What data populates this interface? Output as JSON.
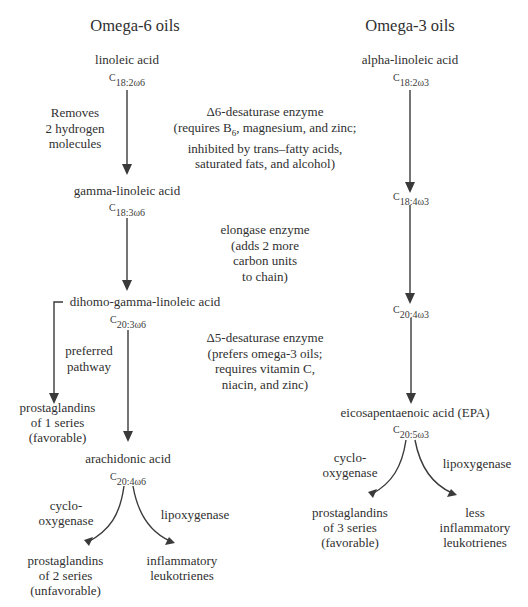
{
  "omega6": {
    "heading": "Omega-6 oils",
    "linoleic": {
      "name": "linoleic acid",
      "formula_c": "C",
      "formula_sub": "18:2ω6"
    },
    "step1_note": "Removes\n2 hydrogen\nmolecules",
    "gamma": {
      "name": "gamma-linoleic acid",
      "formula_c": "C",
      "formula_sub": "18:3ω6"
    },
    "dihomo": {
      "name": "dihomo-gamma-linoleic acid",
      "formula_c": "C",
      "formula_sub": "20:3ω6"
    },
    "preferred_note": "preferred\npathway",
    "pg1": "prostaglandins\nof 1 series\n(favorable)",
    "arachidonic": {
      "name": "arachidonic acid",
      "formula_c": "C",
      "formula_sub": "20:4ω6"
    },
    "cyclo_label": "cyclo-\noxygenase",
    "lipo_label": "lipoxygenase",
    "pg2": "prostaglandins\nof 2 series\n(unfavorable)",
    "leuko": "inflammatory\nleukotrienes"
  },
  "omega3": {
    "heading": "Omega-3 oils",
    "alpha": {
      "name": "alpha-linoleic acid",
      "formula_c": "C",
      "formula_sub": "18:2ω3"
    },
    "c18_4": {
      "formula_c": "C",
      "formula_sub": "18:4ω3"
    },
    "c20_4": {
      "formula_c": "C",
      "formula_sub": "20:4ω3"
    },
    "epa": {
      "name": "eicosapentaenoic acid (EPA)",
      "formula_c": "C",
      "formula_sub": "20:5ω3"
    },
    "cyclo_label": "cyclo-\noxygenase",
    "lipo_label": "lipoxygenase",
    "pg3": "prostaglandins\nof 3 series\n(favorable)",
    "leuko": "less\ninflammatory\nleukotrienes"
  },
  "enzymes": {
    "d6": {
      "line1": "Δ6-desaturase enzyme",
      "line2_pre": "(requires B",
      "line2_sub": "6",
      "line2_post": ", magnesium, and zinc;",
      "line3": "inhibited by trans–fatty acids,",
      "line4": "saturated fats, and alcohol)"
    },
    "elongase": "elongase enzyme\n(adds 2 more\ncarbon units\nto chain)",
    "d5": "Δ5-desaturase enzyme\n(prefers omega-3 oils;\nrequires vitamin C,\nniacin, and zinc)"
  },
  "colors": {
    "text": "#2f2f2f",
    "arrow": "#3a3a3a",
    "background": "#ffffff"
  }
}
